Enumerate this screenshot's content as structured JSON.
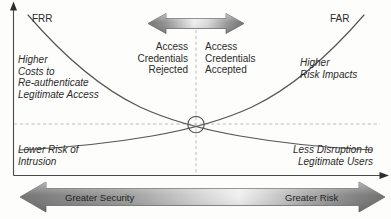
{
  "figure": {
    "curves": {
      "frr": {
        "label": "FRR",
        "meaning": "False Rejection Rate",
        "trend": "decreasing"
      },
      "far": {
        "label": "FAR",
        "meaning": "False Acceptance Rate",
        "trend": "increasing"
      }
    },
    "crossover": {
      "marker": "circle",
      "x_fraction": 0.5
    },
    "axes": {
      "y_axis": {
        "arrow": "up"
      },
      "x_axis": {
        "arrow": "right"
      }
    },
    "guides": {
      "horizontal_dashed": true,
      "vertical_dashed": true
    }
  },
  "labels": {
    "frr": "FRR",
    "far": "FAR",
    "upper_left": "Higher\nCosts to\nRe-authenticate\nLegitimate Access",
    "upper_right": "Higher\nRisk Impacts",
    "lower_left": "Lower Risk of\nIntrusion",
    "lower_right": "Less Disruption to\nLegitimate Users",
    "rejected": "Access\nCredentials\nRejected",
    "accepted": "Access\nCredentials\nAccepted"
  },
  "bottom_band": {
    "left_label": "Greater Security",
    "right_label": "Greater Risk",
    "arrow": "double-headed"
  },
  "top_arrow": {
    "arrow": "double-headed",
    "left_meaning": "Access Credentials Rejected",
    "right_meaning": "Access Credentials Accepted"
  },
  "colors": {
    "line": "#4a4a4a",
    "text": "#2b2b2b",
    "guide": "#b9b9b9",
    "arrow_dark": "#6f6f6f",
    "arrow_light": "#e9e9e9",
    "background": "#fdfdfc"
  }
}
